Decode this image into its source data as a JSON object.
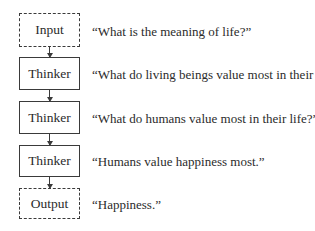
{
  "diagram": {
    "nodes": [
      {
        "label": "Input",
        "style": "dashed",
        "text": "“What is the meaning of life?”"
      },
      {
        "label": "Thinker",
        "style": "solid",
        "text": "“What do living beings value most in their life?”"
      },
      {
        "label": "Thinker",
        "style": "solid",
        "text": "“What do humans value most in their life?”"
      },
      {
        "label": "Thinker",
        "style": "solid",
        "text": "“Humans value happiness most.”"
      },
      {
        "label": "Output",
        "style": "dashed",
        "text": "“Happiness.”"
      }
    ],
    "edges": [
      {
        "from": "Input",
        "to": "Thinker 1"
      },
      {
        "from": "Thinker 1",
        "to": "Thinker 2"
      },
      {
        "from": "Thinker 2",
        "to": "Thinker 3"
      },
      {
        "from": "Thinker 3",
        "to": "Output"
      }
    ]
  }
}
